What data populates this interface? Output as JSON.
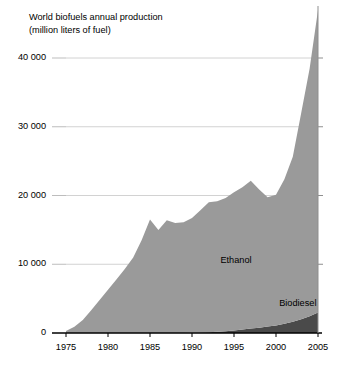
{
  "chart_data": {
    "type": "area",
    "stacked": true,
    "title": "World biofuels annual production",
    "subtitle": "(million liters of fuel)",
    "xlabel": "",
    "ylabel": "",
    "xlim": [
      1975,
      2005
    ],
    "ylim": [
      0,
      40000
    ],
    "y_axis_note": "Topmost ethanol value at 2005 extends above the 40 000 gridline",
    "grid": true,
    "grid_axis": "y",
    "legend_position": "inline-labels",
    "xticks": [
      1975,
      1980,
      1985,
      1990,
      1995,
      2000,
      2005
    ],
    "xtick_labels": [
      "1975",
      "1980",
      "1985",
      "1990",
      "1995",
      "2000",
      "2005"
    ],
    "yticks": [
      0,
      10000,
      20000,
      30000,
      40000
    ],
    "ytick_labels": [
      "0",
      "10 000",
      "20 000",
      "30 000",
      "40 000"
    ],
    "x": [
      1975,
      1976,
      1977,
      1978,
      1979,
      1980,
      1981,
      1982,
      1983,
      1984,
      1985,
      1986,
      1987,
      1988,
      1989,
      1990,
      1991,
      1992,
      1993,
      1994,
      1995,
      1996,
      1997,
      1998,
      1999,
      2000,
      2001,
      2002,
      2003,
      2004,
      2005
    ],
    "series": [
      {
        "name": "Biodiesel",
        "color": "#4a4a4a",
        "values": [
          0,
          0,
          0,
          0,
          0,
          0,
          0,
          0,
          0,
          0,
          0,
          0,
          0,
          0,
          0,
          40,
          70,
          110,
          170,
          250,
          380,
          510,
          650,
          780,
          930,
          1100,
          1350,
          1650,
          2000,
          2450,
          3000
        ]
      },
      {
        "name": "Ethanol",
        "color": "#9a9a9a",
        "values": [
          300,
          900,
          1900,
          3300,
          4800,
          6300,
          7800,
          9300,
          11000,
          13500,
          16500,
          15000,
          16400,
          16000,
          16100,
          16700,
          17800,
          18900,
          19000,
          19400,
          20100,
          20700,
          21500,
          20100,
          18800,
          19000,
          21000,
          24000,
          30000,
          36000,
          44000
        ]
      }
    ],
    "annotations": [
      {
        "text": "Ethanol",
        "x": 1996,
        "y": 10500
      },
      {
        "text": "Biodiesel",
        "x": 2003,
        "y": 4200
      }
    ]
  },
  "axes_geometry": {
    "left_px": 66,
    "right_px": 318,
    "top_px": 58,
    "bottom_px": 333
  }
}
